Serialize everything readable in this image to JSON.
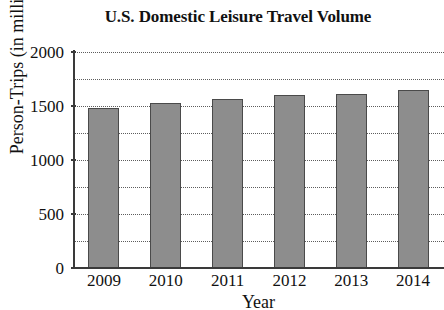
{
  "chart_data": {
    "type": "bar",
    "title": "U.S. Domestic Leisure Travel Volume",
    "xlabel": "Year",
    "ylabel": "Person-Trips (in millions)",
    "categories": [
      "2009",
      "2010",
      "2011",
      "2012",
      "2013",
      "2014"
    ],
    "values": [
      1480,
      1530,
      1565,
      1600,
      1615,
      1650
    ],
    "ylim": [
      0,
      2000
    ],
    "ytick_labels": [
      "0",
      "500",
      "1000",
      "1500",
      "2000"
    ],
    "ytick_values": [
      0,
      500,
      1000,
      1500,
      2000
    ],
    "gridline_values": [
      250,
      500,
      750,
      1000,
      1250,
      1500,
      1750,
      2000
    ],
    "grid": true,
    "grid_style": "dotted",
    "legend": "none",
    "bar_color": "#8d8d8d",
    "bar_edge_color": "#4a4a4a",
    "axis_color": "#3a3a3a",
    "background_color": "#ffffff"
  }
}
